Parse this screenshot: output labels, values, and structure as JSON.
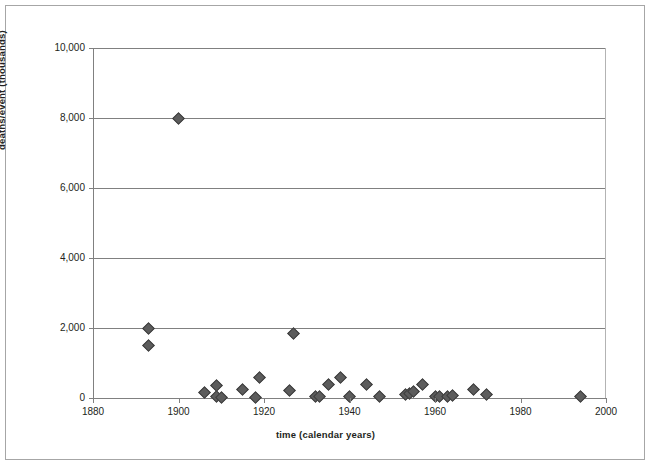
{
  "chart_data": {
    "type": "scatter",
    "title": "",
    "xlabel": "time (calendar years)",
    "ylabel": "deaths/event (thousands)",
    "xlim": [
      1880,
      2000
    ],
    "ylim": [
      0,
      10000
    ],
    "xticks": [
      1880,
      1900,
      1920,
      1940,
      1960,
      1980,
      2000
    ],
    "xtick_labels": [
      "1880",
      "1900",
      "1920",
      "1940",
      "1960",
      "1980",
      "2000"
    ],
    "yticks": [
      0,
      2000,
      4000,
      6000,
      8000,
      10000
    ],
    "ytick_labels": [
      "0",
      "2,000",
      "4,000",
      "6,000",
      "8,000",
      "10,000"
    ],
    "grid": "horizontal",
    "legend": "none",
    "marker": "diamond",
    "marker_color": "#5c5c5c",
    "marker_edge_color": "#3d3d3d",
    "gridline_color": "#808080",
    "axis_color": "#808080",
    "frame_color": "#a6a6a6",
    "text_color": "#231f20",
    "points": [
      {
        "x": 1900,
        "y": 8000
      },
      {
        "x": 1893,
        "y": 2000
      },
      {
        "x": 1893,
        "y": 1500
      },
      {
        "x": 1927,
        "y": 1840
      },
      {
        "x": 1906,
        "y": 145
      },
      {
        "x": 1909,
        "y": 355
      },
      {
        "x": 1909,
        "y": 30
      },
      {
        "x": 1910,
        "y": 25
      },
      {
        "x": 1915,
        "y": 255
      },
      {
        "x": 1918,
        "y": 25
      },
      {
        "x": 1919,
        "y": 590
      },
      {
        "x": 1926,
        "y": 225
      },
      {
        "x": 1932,
        "y": 30
      },
      {
        "x": 1933,
        "y": 35
      },
      {
        "x": 1935,
        "y": 400
      },
      {
        "x": 1938,
        "y": 590
      },
      {
        "x": 1940,
        "y": 35
      },
      {
        "x": 1944,
        "y": 390
      },
      {
        "x": 1947,
        "y": 45
      },
      {
        "x": 1953,
        "y": 95
      },
      {
        "x": 1954,
        "y": 135
      },
      {
        "x": 1955,
        "y": 190
      },
      {
        "x": 1957,
        "y": 400
      },
      {
        "x": 1960,
        "y": 35
      },
      {
        "x": 1961,
        "y": 30
      },
      {
        "x": 1963,
        "y": 40
      },
      {
        "x": 1964,
        "y": 70
      },
      {
        "x": 1969,
        "y": 250
      },
      {
        "x": 1972,
        "y": 110
      },
      {
        "x": 1994,
        "y": 50
      }
    ]
  },
  "figure": {
    "background_color": "#ffffff",
    "width": 651,
    "height": 466
  }
}
